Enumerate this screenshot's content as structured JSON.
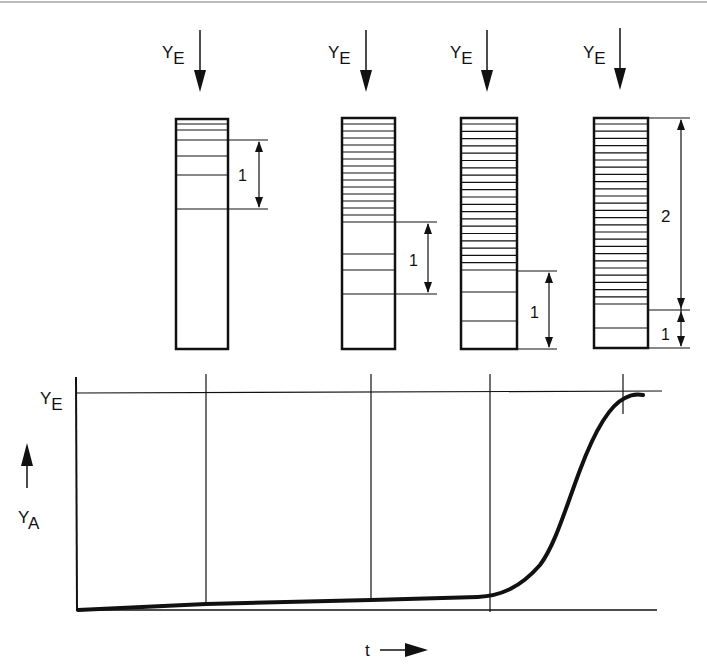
{
  "diagram": {
    "top_labels": [
      "YE",
      "YE",
      "YE",
      "YE"
    ],
    "columns": [
      {
        "dim_label": "1"
      },
      {
        "dim_label": "1"
      },
      {
        "dim_label": "1"
      },
      {
        "dim_label_upper": "2",
        "dim_label_lower": "1"
      }
    ],
    "graph": {
      "y_top_label": "YE",
      "y_axis_label": "YA",
      "x_axis_label": "t"
    }
  },
  "colors": {
    "ink": "#111111",
    "background": "#ffffff"
  }
}
